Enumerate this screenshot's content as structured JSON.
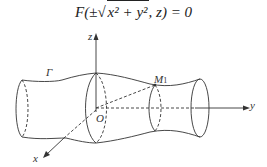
{
  "formula": {
    "fn": "F(",
    "pm": "±",
    "radicand": "x² + y²",
    "rest": ", z) = 0"
  },
  "labels": {
    "z_axis": "z",
    "y_axis": "y",
    "x_axis": "x",
    "origin": "O",
    "curve": "Γ",
    "point": "M",
    "point_sub": "1"
  },
  "colors": {
    "stroke": "#333333",
    "background": "#ffffff"
  }
}
